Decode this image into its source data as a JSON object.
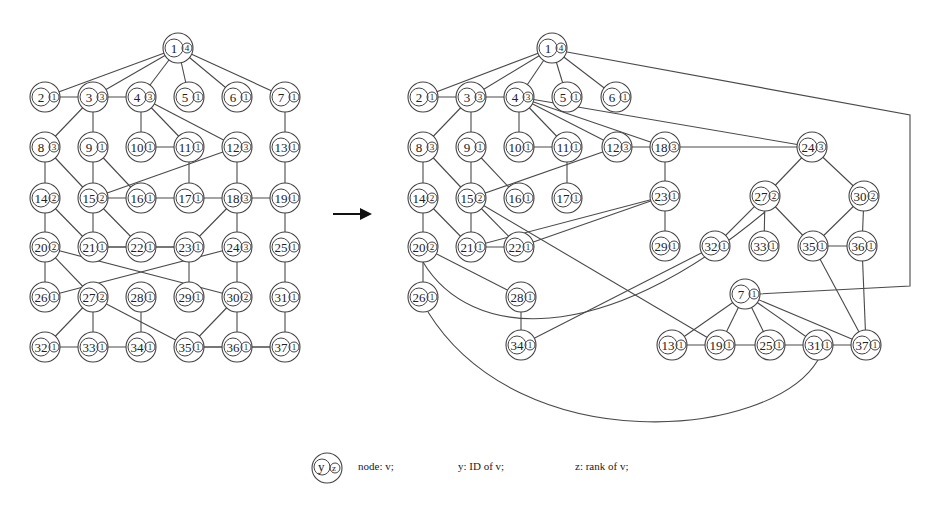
{
  "figure": {
    "arrow": {
      "x1": 333,
      "y1": 214,
      "x2": 370,
      "y2": 214,
      "label": "transformation-arrow"
    },
    "legend": {
      "symbol_id": "y",
      "symbol_rank": "z",
      "node_text": "node: v;",
      "id_text": "y: ID of v;",
      "rank_text": "z: rank of v;"
    }
  },
  "left_graph": {
    "nodes": [
      {
        "id": "1",
        "rank": "4",
        "x": 178,
        "y": 48
      },
      {
        "id": "2",
        "rank": "1",
        "x": 45,
        "y": 97
      },
      {
        "id": "3",
        "rank": "3",
        "x": 93,
        "y": 97
      },
      {
        "id": "4",
        "rank": "3",
        "x": 141,
        "y": 97
      },
      {
        "id": "5",
        "rank": "1",
        "x": 189,
        "y": 97
      },
      {
        "id": "6",
        "rank": "1",
        "x": 237,
        "y": 97
      },
      {
        "id": "7",
        "rank": "1",
        "x": 285,
        "y": 97
      },
      {
        "id": "8",
        "rank": "3",
        "x": 45,
        "y": 147
      },
      {
        "id": "9",
        "rank": "1",
        "x": 93,
        "y": 147
      },
      {
        "id": "10",
        "rank": "1",
        "x": 141,
        "y": 147
      },
      {
        "id": "11",
        "rank": "1",
        "x": 189,
        "y": 147
      },
      {
        "id": "12",
        "rank": "3",
        "x": 237,
        "y": 147
      },
      {
        "id": "13",
        "rank": "1",
        "x": 285,
        "y": 147
      },
      {
        "id": "14",
        "rank": "2",
        "x": 45,
        "y": 198
      },
      {
        "id": "15",
        "rank": "2",
        "x": 93,
        "y": 198
      },
      {
        "id": "16",
        "rank": "1",
        "x": 141,
        "y": 198
      },
      {
        "id": "17",
        "rank": "1",
        "x": 189,
        "y": 198
      },
      {
        "id": "18",
        "rank": "3",
        "x": 237,
        "y": 198
      },
      {
        "id": "19",
        "rank": "1",
        "x": 285,
        "y": 198
      },
      {
        "id": "20",
        "rank": "2",
        "x": 45,
        "y": 247
      },
      {
        "id": "21",
        "rank": "1",
        "x": 93,
        "y": 247
      },
      {
        "id": "22",
        "rank": "1",
        "x": 141,
        "y": 247
      },
      {
        "id": "23",
        "rank": "1",
        "x": 189,
        "y": 247
      },
      {
        "id": "24",
        "rank": "3",
        "x": 237,
        "y": 247
      },
      {
        "id": "25",
        "rank": "1",
        "x": 285,
        "y": 247
      },
      {
        "id": "26",
        "rank": "1",
        "x": 45,
        "y": 297
      },
      {
        "id": "27",
        "rank": "2",
        "x": 93,
        "y": 297
      },
      {
        "id": "28",
        "rank": "1",
        "x": 141,
        "y": 297
      },
      {
        "id": "29",
        "rank": "1",
        "x": 189,
        "y": 297
      },
      {
        "id": "30",
        "rank": "2",
        "x": 237,
        "y": 297
      },
      {
        "id": "31",
        "rank": "1",
        "x": 285,
        "y": 297
      },
      {
        "id": "32",
        "rank": "1",
        "x": 45,
        "y": 347
      },
      {
        "id": "33",
        "rank": "1",
        "x": 93,
        "y": 347
      },
      {
        "id": "34",
        "rank": "1",
        "x": 141,
        "y": 347
      },
      {
        "id": "35",
        "rank": "1",
        "x": 189,
        "y": 347
      },
      {
        "id": "36",
        "rank": "1",
        "x": 237,
        "y": 347
      },
      {
        "id": "37",
        "rank": "1",
        "x": 285,
        "y": 347
      }
    ],
    "edges": [
      [
        "1",
        "2"
      ],
      [
        "1",
        "3"
      ],
      [
        "1",
        "4"
      ],
      [
        "1",
        "5"
      ],
      [
        "1",
        "6"
      ],
      [
        "1",
        "7"
      ],
      [
        "2",
        "4"
      ],
      [
        "3",
        "8"
      ],
      [
        "3",
        "9"
      ],
      [
        "4",
        "10"
      ],
      [
        "4",
        "11"
      ],
      [
        "4",
        "12"
      ],
      [
        "10",
        "11"
      ],
      [
        "7",
        "13"
      ],
      [
        "8",
        "14"
      ],
      [
        "8",
        "15"
      ],
      [
        "9",
        "15"
      ],
      [
        "9",
        "16"
      ],
      [
        "11",
        "17"
      ],
      [
        "12",
        "18"
      ],
      [
        "12",
        "15"
      ],
      [
        "15",
        "19"
      ],
      [
        "13",
        "19"
      ],
      [
        "14",
        "20"
      ],
      [
        "14",
        "21"
      ],
      [
        "15",
        "21"
      ],
      [
        "15",
        "22"
      ],
      [
        "18",
        "23"
      ],
      [
        "21",
        "23"
      ],
      [
        "18",
        "24"
      ],
      [
        "19",
        "25"
      ],
      [
        "21",
        "22"
      ],
      [
        "22",
        "23"
      ],
      [
        "20",
        "26"
      ],
      [
        "20",
        "27"
      ],
      [
        "20",
        "30"
      ],
      [
        "24",
        "26"
      ],
      [
        "24",
        "30"
      ],
      [
        "23",
        "29"
      ],
      [
        "25",
        "31"
      ],
      [
        "27",
        "32"
      ],
      [
        "27",
        "33"
      ],
      [
        "27",
        "35"
      ],
      [
        "28",
        "34"
      ],
      [
        "30",
        "35"
      ],
      [
        "30",
        "36"
      ],
      [
        "31",
        "37"
      ],
      [
        "32",
        "34"
      ],
      [
        "35",
        "36"
      ],
      [
        "35",
        "37"
      ],
      [
        "36",
        "37"
      ]
    ]
  },
  "right_graph": {
    "nodes": [
      {
        "id": "1",
        "rank": "4",
        "x": 552,
        "y": 48
      },
      {
        "id": "2",
        "rank": "1",
        "x": 423,
        "y": 97
      },
      {
        "id": "3",
        "rank": "3",
        "x": 471,
        "y": 97
      },
      {
        "id": "4",
        "rank": "3",
        "x": 519,
        "y": 97
      },
      {
        "id": "5",
        "rank": "1",
        "x": 567,
        "y": 97
      },
      {
        "id": "6",
        "rank": "1",
        "x": 616,
        "y": 97
      },
      {
        "id": "8",
        "rank": "3",
        "x": 423,
        "y": 147
      },
      {
        "id": "9",
        "rank": "1",
        "x": 471,
        "y": 147
      },
      {
        "id": "10",
        "rank": "1",
        "x": 519,
        "y": 147
      },
      {
        "id": "11",
        "rank": "1",
        "x": 567,
        "y": 147
      },
      {
        "id": "12",
        "rank": "3",
        "x": 617,
        "y": 147
      },
      {
        "id": "18",
        "rank": "3",
        "x": 665,
        "y": 147
      },
      {
        "id": "24",
        "rank": "3",
        "x": 812,
        "y": 147
      },
      {
        "id": "14",
        "rank": "2",
        "x": 423,
        "y": 198
      },
      {
        "id": "15",
        "rank": "2",
        "x": 471,
        "y": 198
      },
      {
        "id": "16",
        "rank": "1",
        "x": 519,
        "y": 198
      },
      {
        "id": "17",
        "rank": "1",
        "x": 567,
        "y": 198
      },
      {
        "id": "23",
        "rank": "1",
        "x": 665,
        "y": 196
      },
      {
        "id": "27",
        "rank": "2",
        "x": 765,
        "y": 196
      },
      {
        "id": "30",
        "rank": "2",
        "x": 864,
        "y": 196
      },
      {
        "id": "20",
        "rank": "2",
        "x": 423,
        "y": 247
      },
      {
        "id": "21",
        "rank": "1",
        "x": 471,
        "y": 247
      },
      {
        "id": "22",
        "rank": "1",
        "x": 519,
        "y": 247
      },
      {
        "id": "29",
        "rank": "1",
        "x": 665,
        "y": 246
      },
      {
        "id": "32",
        "rank": "1",
        "x": 715,
        "y": 246
      },
      {
        "id": "33",
        "rank": "1",
        "x": 764,
        "y": 246
      },
      {
        "id": "35",
        "rank": "1",
        "x": 813,
        "y": 246
      },
      {
        "id": "36",
        "rank": "1",
        "x": 862,
        "y": 246
      },
      {
        "id": "26",
        "rank": "1",
        "x": 423,
        "y": 297
      },
      {
        "id": "28",
        "rank": "1",
        "x": 521,
        "y": 297
      },
      {
        "id": "7",
        "rank": "1",
        "x": 745,
        "y": 294
      },
      {
        "id": "34",
        "rank": "1",
        "x": 521,
        "y": 345
      },
      {
        "id": "13",
        "rank": "1",
        "x": 672,
        "y": 345
      },
      {
        "id": "19",
        "rank": "1",
        "x": 720,
        "y": 345
      },
      {
        "id": "25",
        "rank": "1",
        "x": 770,
        "y": 345
      },
      {
        "id": "31",
        "rank": "1",
        "x": 818,
        "y": 345
      },
      {
        "id": "37",
        "rank": "1",
        "x": 866,
        "y": 345
      }
    ],
    "edges": [
      [
        "1",
        "2"
      ],
      [
        "1",
        "3"
      ],
      [
        "1",
        "4"
      ],
      [
        "1",
        "5"
      ],
      [
        "1",
        "6"
      ],
      [
        "2",
        "4"
      ],
      [
        "3",
        "8"
      ],
      [
        "3",
        "9"
      ],
      [
        "4",
        "10"
      ],
      [
        "4",
        "11"
      ],
      [
        "4",
        "12"
      ],
      [
        "4",
        "18"
      ],
      [
        "4",
        "24"
      ],
      [
        "10",
        "11"
      ],
      [
        "12",
        "18"
      ],
      [
        "18",
        "24"
      ],
      [
        "8",
        "14"
      ],
      [
        "8",
        "15"
      ],
      [
        "9",
        "15"
      ],
      [
        "9",
        "16"
      ],
      [
        "11",
        "17"
      ],
      [
        "12",
        "15"
      ],
      [
        "18",
        "23"
      ],
      [
        "24",
        "27"
      ],
      [
        "24",
        "30"
      ],
      [
        "14",
        "20"
      ],
      [
        "14",
        "21"
      ],
      [
        "15",
        "21"
      ],
      [
        "15",
        "22"
      ],
      [
        "15",
        "19"
      ],
      [
        "21",
        "22"
      ],
      [
        "23",
        "21"
      ],
      [
        "23",
        "22"
      ],
      [
        "23",
        "29"
      ],
      [
        "27",
        "32"
      ],
      [
        "27",
        "33"
      ],
      [
        "27",
        "35"
      ],
      [
        "30",
        "35"
      ],
      [
        "30",
        "36"
      ],
      [
        "35",
        "36"
      ],
      [
        "35",
        "37"
      ],
      [
        "36",
        "37"
      ],
      [
        "20",
        "26"
      ],
      [
        "20",
        "28"
      ],
      [
        "28",
        "34"
      ],
      [
        "32",
        "34"
      ],
      [
        "7",
        "13"
      ],
      [
        "7",
        "19"
      ],
      [
        "7",
        "25"
      ],
      [
        "7",
        "31"
      ],
      [
        "7",
        "37"
      ],
      [
        "13",
        "19"
      ],
      [
        "19",
        "25"
      ],
      [
        "25",
        "31"
      ],
      [
        "31",
        "37"
      ]
    ],
    "curved_edges": [
      {
        "from": "20",
        "to": "27",
        "path": "M423,262 C470,340 600,350 765,212"
      },
      {
        "from": "26",
        "to": "31",
        "path": "M428,312 C520,460 770,440 818,360"
      },
      {
        "from": "1",
        "to": "7",
        "path": "M567,52 L910,115 L910,286 L758,294"
      }
    ]
  }
}
